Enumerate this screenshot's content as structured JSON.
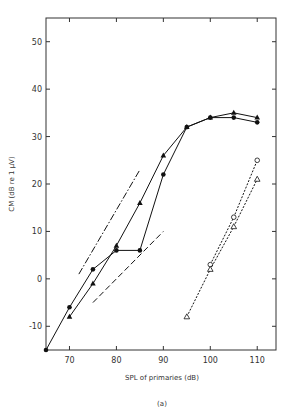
{
  "chart_data": {
    "type": "line",
    "title": "",
    "caption": "(a)",
    "xlabel": "SPL of primaries (dB)",
    "ylabel": "CM (dB re 1 μV)",
    "xlim": [
      65,
      114
    ],
    "ylim": [
      -15,
      55
    ],
    "xticks": [
      70,
      80,
      90,
      100,
      110
    ],
    "yticks": [
      -10,
      0,
      10,
      20,
      30,
      40,
      50
    ],
    "grid": false,
    "legend": null,
    "series": [
      {
        "name": "filled circles (solid)",
        "marker": "filled-circle",
        "line": "solid",
        "x": [
          65,
          70,
          75,
          80,
          85,
          90,
          95,
          100,
          105,
          110
        ],
        "y": [
          -15,
          -6,
          2,
          6,
          6,
          22,
          32,
          34,
          34,
          33
        ]
      },
      {
        "name": "filled triangles (solid)",
        "marker": "filled-triangle",
        "line": "solid",
        "x": [
          70,
          75,
          80,
          85,
          90,
          95,
          100,
          105,
          110
        ],
        "y": [
          -8,
          -1,
          7,
          16,
          26,
          32,
          34,
          35,
          34
        ]
      },
      {
        "name": "open circles (dotted)",
        "marker": "open-circle",
        "line": "dotted",
        "x": [
          100,
          105,
          110
        ],
        "y": [
          3,
          13,
          25
        ]
      },
      {
        "name": "open triangles (dotted)",
        "marker": "open-triangle",
        "line": "dotted",
        "x": [
          95,
          100,
          105,
          110
        ],
        "y": [
          -8,
          2,
          11,
          21
        ]
      },
      {
        "name": "reference dash-dot",
        "marker": "none",
        "line": "dash-dot",
        "x": [
          72,
          85
        ],
        "y": [
          1,
          23
        ]
      },
      {
        "name": "reference dashed",
        "marker": "none",
        "line": "dashed",
        "x": [
          75,
          90
        ],
        "y": [
          -5,
          10
        ]
      }
    ]
  }
}
